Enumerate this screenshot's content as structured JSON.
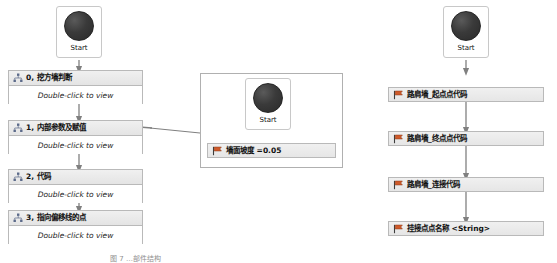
{
  "diagram": {
    "type": "flowchart",
    "start_label": "Start",
    "body_hint": "Double-click to view",
    "columns": [
      {
        "name": "left-column",
        "start": {
          "label": "Start"
        },
        "nodes": [
          {
            "title": "0, 挖方墙判断",
            "body": "Double-click to view",
            "icon": "hierarchy-icon"
          },
          {
            "title": "1, 内部参数及赋值",
            "body": "Double-click to view",
            "icon": "hierarchy-icon"
          },
          {
            "title": "2, 代码",
            "body": "Double-click to view",
            "icon": "hierarchy-icon"
          },
          {
            "title": "3, 指向偏移线的点",
            "body": "Double-click to view",
            "icon": "hierarchy-icon"
          }
        ]
      },
      {
        "name": "middle-group",
        "start": {
          "label": "Start"
        },
        "nodes": [
          {
            "title": "墙面坡度 =0.05",
            "icon": "flag-icon"
          }
        ]
      },
      {
        "name": "right-column",
        "start": {
          "label": "Start"
        },
        "nodes": [
          {
            "title": "路肩墙_起点点代码",
            "icon": "flag-icon"
          },
          {
            "title": "路肩墙_终点点代码",
            "icon": "flag-icon"
          },
          {
            "title": "路肩墙_连接代码",
            "icon": "flag-icon"
          },
          {
            "title": "挂接点点名称 <String>",
            "icon": "flag-icon"
          }
        ]
      }
    ],
    "caption": "图 7 …部件结构"
  },
  "colors": {
    "node_border": "#b9b9b9",
    "header_fill": "#ececec",
    "body_fill": "#ffffff",
    "connector": "#808080",
    "start_ball": "#333333"
  }
}
